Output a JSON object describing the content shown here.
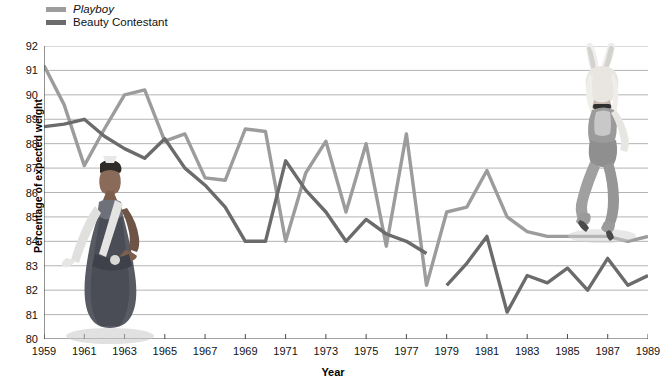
{
  "legend": {
    "items": [
      {
        "label": "Playboy",
        "color": "#9c9c9c",
        "italic": true,
        "name": "playboy"
      },
      {
        "label": "Beauty Contestant",
        "color": "#6b6b6b",
        "italic": false,
        "name": "beauty-contestant"
      }
    ]
  },
  "chart_data": {
    "type": "line",
    "title": "",
    "xlabel": "Year",
    "ylabel": "Percentage of expected weight",
    "xlim": [
      1959,
      1989
    ],
    "ylim": [
      80,
      92
    ],
    "yticks": [
      80,
      81,
      82,
      83,
      84,
      85,
      86,
      87,
      88,
      89,
      90,
      91,
      92
    ],
    "xticks": [
      1959,
      1961,
      1963,
      1965,
      1967,
      1969,
      1971,
      1973,
      1975,
      1977,
      1979,
      1981,
      1983,
      1985,
      1987,
      1989
    ],
    "grid": true,
    "legend_position": "top-left",
    "series": [
      {
        "name": "Playboy",
        "color": "#9c9c9c",
        "x": [
          1959,
          1960,
          1961,
          1962,
          1963,
          1964,
          1965,
          1966,
          1967,
          1968,
          1969,
          1970,
          1971,
          1972,
          1973,
          1974,
          1975,
          1976,
          1977,
          1978,
          1979,
          1980,
          1981,
          1982,
          1983,
          1984,
          1985,
          1986,
          1987,
          1988,
          1989
        ],
        "values": [
          91.2,
          89.6,
          87.1,
          88.6,
          90.0,
          90.2,
          88.1,
          88.4,
          86.6,
          86.5,
          88.6,
          88.5,
          84.0,
          86.8,
          88.1,
          85.2,
          88.0,
          83.8,
          88.4,
          82.2,
          85.2,
          85.4,
          86.9,
          85.0,
          84.4,
          84.2,
          84.2,
          84.2,
          84.2,
          84.0,
          84.2
        ]
      },
      {
        "name": "Beauty Contestant",
        "color": "#6b6b6b",
        "x": [
          1959,
          1960,
          1961,
          1962,
          1963,
          1964,
          1965,
          1966,
          1967,
          1968,
          1969,
          1970,
          1971,
          1972,
          1973,
          1974,
          1975,
          1976,
          1977,
          1978,
          null,
          1979,
          1980,
          1981,
          1982,
          1983,
          1984,
          1985,
          1986,
          1987,
          1988,
          1989
        ],
        "values": [
          88.7,
          88.8,
          89.0,
          88.3,
          87.8,
          87.4,
          88.2,
          87.0,
          86.3,
          85.4,
          84.0,
          84.0,
          87.3,
          86.1,
          85.2,
          84.0,
          84.9,
          84.3,
          84.0,
          83.5,
          null,
          82.2,
          83.1,
          84.2,
          81.1,
          82.6,
          82.3,
          82.9,
          82.0,
          83.3,
          82.2,
          82.6
        ]
      }
    ]
  },
  "figures": [
    {
      "name": "beauty-contestant-photo",
      "alt": "Beauty pageant contestant in gown with sash and crown"
    },
    {
      "name": "playboy-bunny-photo",
      "alt": "Playboy bunny in costume with ears"
    }
  ]
}
